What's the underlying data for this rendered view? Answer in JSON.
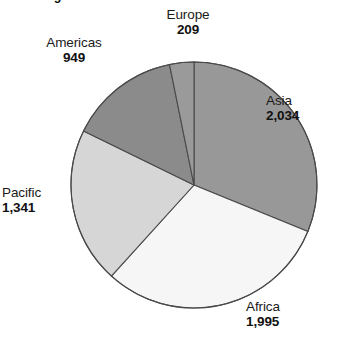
{
  "caption": "in the regions shown.",
  "chart_data": {
    "type": "pie",
    "title": "",
    "subtitle": "",
    "xlabel": "",
    "ylabel": "",
    "legend_position": "none",
    "grid": false,
    "total": 6528,
    "start_angle_deg": 0,
    "direction": "clockwise",
    "center": {
      "x": 194,
      "y": 185
    },
    "radius": 123,
    "categories": [
      "Asia",
      "Africa",
      "Pacific",
      "Americas",
      "Europe"
    ],
    "values": [
      2034,
      1995,
      1341,
      949,
      209
    ],
    "value_labels": [
      "2,034",
      "1,995",
      "1,341",
      "949",
      "209"
    ],
    "slices": [
      {
        "name": "Asia",
        "value": 2034,
        "value_label": "2,034",
        "color": "#989898",
        "start_deg": 0,
        "end_deg": 112.2,
        "clipped_label": true
      },
      {
        "name": "Africa",
        "value": 1995,
        "value_label": "1,995",
        "color": "#f6f6f6",
        "start_deg": 112.2,
        "end_deg": 222.2,
        "clipped_label": false
      },
      {
        "name": "Pacific",
        "value": 1341,
        "value_label": "1,341",
        "color": "#d6d6d6",
        "start_deg": 222.2,
        "end_deg": 296.1,
        "clipped_label": false
      },
      {
        "name": "Americas",
        "value": 949,
        "value_label": "949",
        "color": "#8b8b8b",
        "start_deg": 296.1,
        "end_deg": 348.5,
        "clipped_label": false
      },
      {
        "name": "Europe",
        "value": 209,
        "value_label": "209",
        "color": "#9a9a9a",
        "start_deg": 348.5,
        "end_deg": 360,
        "clipped_label": false
      }
    ],
    "outline_color": "#4a4a4a"
  }
}
